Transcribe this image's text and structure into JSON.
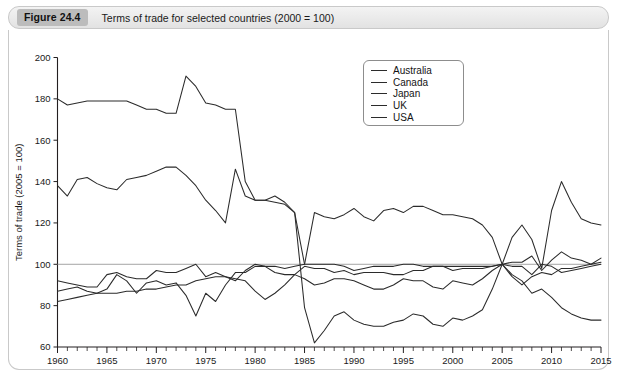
{
  "figure": {
    "badge": "Figure 24.4",
    "caption": "Terms of trade for selected countries (2000 = 100)"
  },
  "chart_data": {
    "type": "line",
    "title": "Terms of trade for selected countries (2000 = 100)",
    "xlabel": "",
    "ylabel": "Terms of trade (2005 = 100)",
    "xlim": [
      1960,
      2015
    ],
    "ylim": [
      60,
      200
    ],
    "ytick_step": 20,
    "yticks": [
      60,
      80,
      100,
      120,
      140,
      160,
      180,
      200
    ],
    "xticks": [
      1960,
      1965,
      1970,
      1975,
      1980,
      1985,
      1990,
      1995,
      2000,
      2005,
      2010,
      2015
    ],
    "x_minor_tick_step": 1,
    "grid": false,
    "reference_line": 100,
    "legend_position": "top-center-right",
    "legend": [
      "Australia",
      "Canada",
      "Japan",
      "UK",
      "USA"
    ],
    "x": [
      1960,
      1961,
      1962,
      1963,
      1964,
      1965,
      1966,
      1967,
      1968,
      1969,
      1970,
      1971,
      1972,
      1973,
      1974,
      1975,
      1976,
      1977,
      1978,
      1979,
      1980,
      1981,
      1982,
      1983,
      1984,
      1985,
      1986,
      1987,
      1988,
      1989,
      1990,
      1991,
      1992,
      1993,
      1994,
      1995,
      1996,
      1997,
      1998,
      1999,
      2000,
      2001,
      2002,
      2003,
      2004,
      2005,
      2006,
      2007,
      2008,
      2009,
      2010,
      2011,
      2012,
      2013,
      2014,
      2015
    ],
    "series": [
      {
        "name": "Australia",
        "values": [
          138,
          133,
          141,
          142,
          139,
          137,
          136,
          141,
          142,
          143,
          145,
          147,
          147,
          143,
          138,
          131,
          126,
          120,
          146,
          133,
          131,
          131,
          130,
          129,
          125,
          79,
          62,
          68,
          75,
          77,
          73,
          71,
          70,
          70,
          72,
          73,
          76,
          75,
          71,
          70,
          74,
          73,
          75,
          78,
          88,
          100,
          113,
          119,
          112,
          98,
          126,
          140,
          130,
          122,
          120,
          119
        ]
      },
      {
        "name": "Canada",
        "values": [
          92,
          91,
          90,
          89,
          89,
          95,
          96,
          94,
          93,
          93,
          97,
          96,
          96,
          98,
          100,
          94,
          96,
          94,
          92,
          97,
          100,
          99,
          96,
          95,
          95,
          93,
          90,
          91,
          93,
          93,
          92,
          90,
          88,
          88,
          90,
          93,
          92,
          92,
          89,
          88,
          92,
          91,
          90,
          93,
          97,
          100,
          101,
          101,
          104,
          97,
          102,
          106,
          103,
          102,
          100,
          103
        ]
      },
      {
        "name": "Japan",
        "values": [
          180,
          177,
          178,
          179,
          179,
          179,
          179,
          179,
          177,
          175,
          175,
          173,
          173,
          191,
          186,
          178,
          177,
          175,
          175,
          140,
          131,
          131,
          133,
          130,
          125,
          100,
          100,
          100,
          100,
          99,
          97,
          98,
          99,
          99,
          99,
          100,
          100,
          99,
          99,
          99,
          99,
          99,
          99,
          99,
          99,
          100,
          95,
          92,
          86,
          88,
          84,
          79,
          76,
          74,
          73,
          73
        ]
      },
      {
        "name": "UK",
        "values": [
          87,
          88,
          89,
          87,
          86,
          88,
          95,
          92,
          86,
          91,
          92,
          90,
          91,
          85,
          75,
          86,
          82,
          90,
          96,
          96,
          99,
          99,
          99,
          98,
          99,
          100,
          125,
          123,
          122,
          124,
          127,
          123,
          121,
          126,
          127,
          125,
          128,
          128,
          126,
          124,
          124,
          123,
          122,
          119,
          113,
          100,
          94,
          90,
          94,
          96,
          95,
          98,
          98,
          99,
          100,
          101
        ]
      },
      {
        "name": "USA",
        "values": [
          82,
          83,
          84,
          85,
          86,
          86,
          86,
          87,
          87,
          88,
          88,
          89,
          90,
          90,
          92,
          93,
          94,
          94,
          93,
          92,
          87,
          83,
          86,
          90,
          95,
          99,
          98,
          98,
          96,
          97,
          95,
          96,
          96,
          96,
          95,
          95,
          97,
          97,
          99,
          99,
          97,
          98,
          98,
          98,
          99,
          100,
          99,
          99,
          95,
          100,
          99,
          96,
          97,
          98,
          99,
          100
        ]
      }
    ]
  }
}
